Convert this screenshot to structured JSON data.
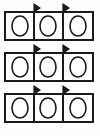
{
  "figure": {
    "background_color": "#fdfdfd",
    "stroke_color": "#1a1a1a",
    "egg_fill": "#ffffff",
    "canvas": {
      "width": 100,
      "height": 136
    }
  },
  "chart_data": {
    "type": "diagram",
    "rows": 3,
    "cells_per_row": 3,
    "eggs_per_cell": 1,
    "total_eggs": 9,
    "flags_per_row": 2,
    "total_flags": 6
  },
  "rows": [
    {
      "id": "row-1",
      "label": "Row 1",
      "box": {
        "x": 5,
        "y": 12,
        "width": 88,
        "height": 28
      },
      "dividers": [
        34,
        63
      ],
      "flags": [
        {
          "x": 34,
          "label": "flag-1"
        },
        {
          "x": 63,
          "label": "flag-2"
        }
      ],
      "cells": [
        {
          "id": "r1c1",
          "label": "Cell 1",
          "egg": {
            "cx": 20,
            "cy": 27
          }
        },
        {
          "id": "r1c2",
          "label": "Cell 2",
          "egg": {
            "cx": 48,
            "cy": 27
          }
        },
        {
          "id": "r1c3",
          "label": "Cell 3",
          "egg": {
            "cx": 78,
            "cy": 27
          }
        }
      ]
    },
    {
      "id": "row-2",
      "label": "Row 2",
      "box": {
        "x": 5,
        "y": 53,
        "width": 88,
        "height": 28
      },
      "dividers": [
        34,
        63
      ],
      "flags": [
        {
          "x": 34,
          "label": "flag-1"
        },
        {
          "x": 63,
          "label": "flag-2"
        }
      ],
      "cells": [
        {
          "id": "r2c1",
          "label": "Cell 1",
          "egg": {
            "cx": 20,
            "cy": 68
          }
        },
        {
          "id": "r2c2",
          "label": "Cell 2",
          "egg": {
            "cx": 48,
            "cy": 68
          }
        },
        {
          "id": "r2c3",
          "label": "Cell 3",
          "egg": {
            "cx": 78,
            "cy": 68
          }
        }
      ]
    },
    {
      "id": "row-3",
      "label": "Row 3",
      "box": {
        "x": 5,
        "y": 94,
        "width": 88,
        "height": 28
      },
      "dividers": [
        34,
        63
      ],
      "flags": [
        {
          "x": 34,
          "label": "flag-1"
        },
        {
          "x": 63,
          "label": "flag-2"
        }
      ],
      "cells": [
        {
          "id": "r3c1",
          "label": "Cell 1",
          "egg": {
            "cx": 20,
            "cy": 109
          }
        },
        {
          "id": "r3c2",
          "label": "Cell 2",
          "egg": {
            "cx": 48,
            "cy": 109
          }
        },
        {
          "id": "r3c3",
          "label": "Cell 3",
          "egg": {
            "cx": 78,
            "cy": 109
          }
        }
      ]
    }
  ]
}
